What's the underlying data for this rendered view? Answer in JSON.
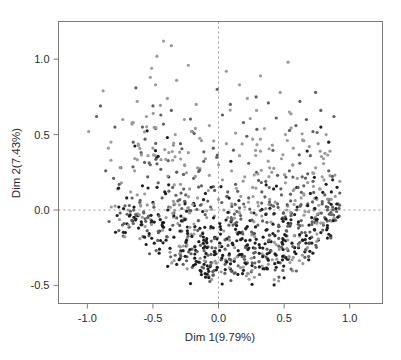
{
  "chart_data": {
    "type": "scatter",
    "title": "",
    "xlabel": "Dim 1(9.79%)",
    "ylabel": "Dim 2(7.43%)",
    "xlim": [
      -1.22,
      1.25
    ],
    "ylim": [
      -0.62,
      1.25
    ],
    "xticks": [
      -1.0,
      -0.5,
      0.0,
      0.5,
      1.0
    ],
    "xticklabels": [
      "-1.0",
      "-0.5",
      "0.0",
      "0.5",
      "1.0"
    ],
    "yticks": [
      -0.5,
      0.0,
      0.5,
      1.0
    ],
    "yticklabels": [
      "-0.5",
      "0.0",
      "0.5",
      "1.0"
    ],
    "grid": false,
    "legend": null,
    "reference_lines": [
      {
        "axis": "vertical",
        "value": 0.0,
        "style": "dashed",
        "color": "#999999"
      },
      {
        "axis": "horizontal",
        "value": 0.0,
        "style": "dashed",
        "color": "#999999"
      }
    ],
    "marker": {
      "shape": "circle",
      "size": 1.6,
      "colors": [
        "#8f8f8f",
        "#5a5a5a",
        "#2a2a2a"
      ]
    },
    "n_points": 1020,
    "point_colors": {
      "light_gray": "#9a9a9a",
      "mid_gray": "#606060",
      "dark": "#1f1f1f"
    },
    "frame_color": "#7a7a7a",
    "background": "#ffffff",
    "points": [
      [
        -0.99,
        0.52
      ],
      [
        -0.93,
        0.62
      ],
      [
        -0.9,
        0.69
      ],
      [
        -0.88,
        0.79
      ],
      [
        -0.86,
        0.26
      ],
      [
        -0.84,
        0.41
      ],
      [
        -0.82,
        0.33
      ],
      [
        -0.8,
        0.21
      ],
      [
        -0.79,
        0.55
      ],
      [
        -0.77,
        0.14
      ],
      [
        -0.76,
        0.02
      ],
      [
        -0.75,
        -0.02
      ],
      [
        -0.74,
        0.18
      ],
      [
        -0.73,
        0.6
      ],
      [
        -0.72,
        -0.09
      ],
      [
        -0.71,
        -0.15
      ],
      [
        -0.7,
        0.08
      ],
      [
        -0.69,
        0.0
      ],
      [
        -0.68,
        0.03
      ],
      [
        -0.68,
        -0.04
      ],
      [
        -0.67,
        0.12
      ],
      [
        -0.66,
        0.57
      ],
      [
        -0.65,
        0.58
      ],
      [
        -0.65,
        0.45
      ],
      [
        -0.64,
        0.26
      ],
      [
        -0.63,
        -0.06
      ],
      [
        -0.63,
        0.81
      ],
      [
        -0.62,
        0.72
      ],
      [
        -0.62,
        0.1
      ],
      [
        -0.61,
        -0.12
      ],
      [
        -0.6,
        0.05
      ],
      [
        -0.6,
        -0.19
      ],
      [
        -0.59,
        0.38
      ],
      [
        -0.58,
        0.55
      ],
      [
        -0.58,
        0.16
      ],
      [
        -0.57,
        -0.02
      ],
      [
        -0.56,
        -0.11
      ],
      [
        -0.56,
        0.47
      ],
      [
        -0.55,
        0.62
      ],
      [
        -0.54,
        0.22
      ],
      [
        -0.54,
        -0.05
      ],
      [
        -0.53,
        -0.17
      ],
      [
        -0.52,
        0.3
      ],
      [
        -0.52,
        0.88
      ],
      [
        -0.51,
        0.94
      ],
      [
        -0.5,
        0.69
      ],
      [
        -0.5,
        0.41
      ],
      [
        -0.5,
        0.05
      ],
      [
        -0.49,
        -0.08
      ],
      [
        -0.49,
        -0.22
      ],
      [
        -0.48,
        0.54
      ],
      [
        -0.48,
        0.83
      ],
      [
        -0.47,
        1.02
      ],
      [
        -0.47,
        0.35
      ],
      [
        -0.46,
        0.18
      ],
      [
        -0.46,
        -0.03
      ],
      [
        -0.45,
        -0.14
      ],
      [
        -0.45,
        -0.26
      ],
      [
        -0.44,
        0.63
      ],
      [
        -0.44,
        0.27
      ],
      [
        -0.43,
        0.08
      ],
      [
        -0.43,
        -0.1
      ],
      [
        -0.42,
        1.12
      ],
      [
        -0.42,
        0.57
      ],
      [
        -0.41,
        0.4
      ],
      [
        -0.41,
        0.12
      ],
      [
        -0.4,
        -0.05
      ],
      [
        -0.4,
        -0.2
      ],
      [
        -0.39,
        0.74
      ],
      [
        -0.39,
        0.48
      ],
      [
        -0.38,
        0.22
      ],
      [
        -0.38,
        0.02
      ],
      [
        -0.37,
        -0.13
      ],
      [
        -0.37,
        -0.28
      ],
      [
        -0.36,
        1.09
      ],
      [
        -0.36,
        0.66
      ],
      [
        -0.35,
        0.33
      ],
      [
        -0.35,
        0.15
      ],
      [
        -0.34,
        -0.02
      ],
      [
        -0.34,
        -0.18
      ],
      [
        -0.33,
        -0.3
      ],
      [
        -0.33,
        0.5
      ],
      [
        -0.32,
        0.86
      ],
      [
        -0.32,
        0.25
      ],
      [
        -0.31,
        0.06
      ],
      [
        -0.31,
        -0.09
      ],
      [
        -0.3,
        -0.24
      ],
      [
        -0.3,
        -0.33
      ],
      [
        -0.29,
        0.44
      ],
      [
        -0.29,
        0.17
      ],
      [
        -0.28,
        0.01
      ],
      [
        -0.28,
        -0.14
      ],
      [
        -0.27,
        -0.27
      ],
      [
        -0.27,
        -0.36
      ],
      [
        -0.26,
        0.6
      ],
      [
        -0.26,
        0.3
      ],
      [
        -0.25,
        0.1
      ],
      [
        -0.25,
        -0.06
      ],
      [
        -0.24,
        -0.19
      ],
      [
        -0.24,
        -0.31
      ],
      [
        -0.23,
        0.96
      ],
      [
        -0.23,
        0.38
      ],
      [
        -0.22,
        0.14
      ],
      [
        -0.22,
        -0.02
      ],
      [
        -0.21,
        -0.16
      ],
      [
        -0.21,
        -0.29
      ],
      [
        -0.2,
        -0.38
      ],
      [
        -0.2,
        0.52
      ],
      [
        -0.19,
        0.21
      ],
      [
        -0.19,
        0.04
      ],
      [
        -0.18,
        -0.11
      ],
      [
        -0.18,
        -0.24
      ],
      [
        -0.17,
        -0.34
      ],
      [
        -0.17,
        0.7
      ],
      [
        -0.16,
        0.28
      ],
      [
        -0.16,
        0.08
      ],
      [
        -0.15,
        -0.07
      ],
      [
        -0.15,
        -0.21
      ],
      [
        -0.14,
        -0.32
      ],
      [
        -0.14,
        -0.4
      ],
      [
        -0.13,
        0.46
      ],
      [
        -0.13,
        0.16
      ],
      [
        -0.12,
        -0.01
      ],
      [
        -0.12,
        -0.15
      ],
      [
        -0.11,
        -0.27
      ],
      [
        -0.11,
        -0.36
      ],
      [
        -0.1,
        0.34
      ],
      [
        -0.1,
        0.11
      ],
      [
        -0.09,
        -0.05
      ],
      [
        -0.09,
        -0.19
      ],
      [
        -0.08,
        -0.3
      ],
      [
        -0.08,
        -0.39
      ],
      [
        -0.07,
        0.56
      ],
      [
        -0.07,
        0.23
      ],
      [
        -0.06,
        0.02
      ],
      [
        -0.06,
        -0.12
      ],
      [
        -0.05,
        -0.25
      ],
      [
        -0.05,
        -0.35
      ],
      [
        -0.04,
        -0.43
      ],
      [
        -0.04,
        0.41
      ],
      [
        -0.03,
        0.13
      ],
      [
        -0.03,
        -0.04
      ],
      [
        -0.02,
        -0.18
      ],
      [
        -0.02,
        -0.29
      ],
      [
        -0.01,
        -0.38
      ],
      [
        -0.01,
        0.8
      ],
      [
        0.0,
        0.3
      ],
      [
        0.0,
        0.07
      ],
      [
        0.01,
        -0.09
      ],
      [
        0.01,
        -0.22
      ],
      [
        0.02,
        -0.33
      ],
      [
        0.02,
        -0.41
      ],
      [
        0.03,
        0.63
      ],
      [
        0.03,
        0.2
      ],
      [
        0.04,
        0.0
      ],
      [
        0.04,
        -0.14
      ],
      [
        0.05,
        -0.26
      ],
      [
        0.05,
        -0.36
      ],
      [
        0.06,
        0.92
      ],
      [
        0.06,
        0.44
      ],
      [
        0.07,
        0.12
      ],
      [
        0.07,
        -0.05
      ],
      [
        0.08,
        -0.18
      ],
      [
        0.08,
        -0.3
      ],
      [
        0.09,
        -0.39
      ],
      [
        0.09,
        0.7
      ],
      [
        0.1,
        0.26
      ],
      [
        0.1,
        0.04
      ],
      [
        0.11,
        -0.1
      ],
      [
        0.11,
        -0.23
      ],
      [
        0.12,
        -0.34
      ],
      [
        0.12,
        -0.42
      ],
      [
        0.13,
        0.51
      ],
      [
        0.13,
        0.17
      ],
      [
        0.14,
        -0.01
      ],
      [
        0.14,
        -0.15
      ],
      [
        0.15,
        -0.27
      ],
      [
        0.15,
        -0.37
      ],
      [
        0.16,
        0.83
      ],
      [
        0.16,
        0.36
      ],
      [
        0.17,
        0.09
      ],
      [
        0.17,
        -0.06
      ],
      [
        0.18,
        -0.19
      ],
      [
        0.18,
        -0.31
      ],
      [
        0.19,
        -0.4
      ],
      [
        0.19,
        0.58
      ],
      [
        0.2,
        0.22
      ],
      [
        0.2,
        0.02
      ],
      [
        0.21,
        -0.12
      ],
      [
        0.21,
        -0.24
      ],
      [
        0.22,
        -0.35
      ],
      [
        0.22,
        0.74
      ],
      [
        0.23,
        0.31
      ],
      [
        0.23,
        0.08
      ],
      [
        0.24,
        -0.07
      ],
      [
        0.24,
        -0.2
      ],
      [
        0.25,
        -0.32
      ],
      [
        0.25,
        -0.41
      ],
      [
        0.26,
        0.47
      ],
      [
        0.26,
        0.15
      ],
      [
        0.27,
        -0.02
      ],
      [
        0.27,
        -0.16
      ],
      [
        0.28,
        -0.28
      ],
      [
        0.28,
        -0.38
      ],
      [
        0.29,
        0.66
      ],
      [
        0.29,
        0.25
      ],
      [
        0.3,
        0.05
      ],
      [
        0.3,
        -0.1
      ],
      [
        0.31,
        -0.23
      ],
      [
        0.31,
        -0.34
      ],
      [
        0.32,
        0.89
      ],
      [
        0.32,
        0.39
      ],
      [
        0.33,
        0.12
      ],
      [
        0.33,
        -0.04
      ],
      [
        0.34,
        -0.18
      ],
      [
        0.34,
        -0.3
      ],
      [
        0.35,
        -0.39
      ],
      [
        0.35,
        0.54
      ],
      [
        0.36,
        0.19
      ],
      [
        0.36,
        0.01
      ],
      [
        0.37,
        -0.13
      ],
      [
        0.37,
        -0.26
      ],
      [
        0.38,
        -0.36
      ],
      [
        0.38,
        0.71
      ],
      [
        0.39,
        0.28
      ],
      [
        0.39,
        0.07
      ],
      [
        0.4,
        -0.08
      ],
      [
        0.4,
        -0.21
      ],
      [
        0.41,
        -0.33
      ],
      [
        0.41,
        0.43
      ],
      [
        0.42,
        0.14
      ],
      [
        0.42,
        -0.03
      ],
      [
        0.43,
        -0.17
      ],
      [
        0.43,
        -0.29
      ],
      [
        0.44,
        -0.38
      ],
      [
        0.44,
        0.61
      ],
      [
        0.45,
        0.23
      ],
      [
        0.45,
        0.04
      ],
      [
        0.46,
        -0.11
      ],
      [
        0.46,
        -0.24
      ],
      [
        0.47,
        -0.35
      ],
      [
        0.47,
        0.78
      ],
      [
        0.48,
        0.34
      ],
      [
        0.48,
        0.1
      ],
      [
        0.49,
        -0.05
      ],
      [
        0.49,
        -0.19
      ],
      [
        0.5,
        -0.31
      ],
      [
        0.5,
        -0.45
      ],
      [
        0.51,
        0.5
      ],
      [
        0.51,
        0.18
      ],
      [
        0.52,
        0.0
      ],
      [
        0.52,
        -0.14
      ],
      [
        0.53,
        -0.27
      ],
      [
        0.53,
        0.98
      ],
      [
        0.54,
        0.65
      ],
      [
        0.54,
        0.26
      ],
      [
        0.55,
        0.06
      ],
      [
        0.55,
        -0.09
      ],
      [
        0.56,
        -0.22
      ],
      [
        0.56,
        -0.33
      ],
      [
        0.57,
        0.41
      ],
      [
        0.57,
        0.13
      ],
      [
        0.58,
        -0.03
      ],
      [
        0.58,
        -0.17
      ],
      [
        0.59,
        -0.29
      ],
      [
        0.59,
        0.56
      ],
      [
        0.6,
        0.21
      ],
      [
        0.6,
        0.02
      ],
      [
        0.61,
        -0.12
      ],
      [
        0.61,
        -0.25
      ],
      [
        0.62,
        0.72
      ],
      [
        0.62,
        0.31
      ],
      [
        0.63,
        0.08
      ],
      [
        0.63,
        -0.07
      ],
      [
        0.64,
        -0.2
      ],
      [
        0.64,
        -0.3
      ],
      [
        0.65,
        0.46
      ],
      [
        0.65,
        0.16
      ],
      [
        0.66,
        -0.01
      ],
      [
        0.66,
        -0.15
      ],
      [
        0.67,
        -0.26
      ],
      [
        0.67,
        0.6
      ],
      [
        0.68,
        0.24
      ],
      [
        0.68,
        0.04
      ],
      [
        0.69,
        -0.1
      ],
      [
        0.69,
        -0.22
      ],
      [
        0.7,
        0.36
      ],
      [
        0.7,
        0.11
      ],
      [
        0.71,
        -0.05
      ],
      [
        0.71,
        -0.18
      ],
      [
        0.72,
        0.52
      ],
      [
        0.72,
        0.19
      ],
      [
        0.73,
        0.01
      ],
      [
        0.73,
        -0.13
      ],
      [
        0.74,
        0.78
      ],
      [
        0.74,
        0.28
      ],
      [
        0.75,
        0.07
      ],
      [
        0.75,
        -0.08
      ],
      [
        0.76,
        -0.2
      ],
      [
        0.76,
        0.44
      ],
      [
        0.77,
        0.14
      ],
      [
        0.77,
        -0.02
      ],
      [
        0.78,
        -0.15
      ],
      [
        0.78,
        0.66
      ],
      [
        0.79,
        0.22
      ],
      [
        0.79,
        0.04
      ],
      [
        0.8,
        -0.1
      ],
      [
        0.8,
        0.34
      ],
      [
        0.81,
        0.1
      ],
      [
        0.81,
        -0.05
      ],
      [
        0.82,
        0.5
      ],
      [
        0.82,
        0.17
      ],
      [
        0.83,
        0.0
      ],
      [
        0.83,
        -0.12
      ],
      [
        0.84,
        0.26
      ],
      [
        0.84,
        0.07
      ],
      [
        0.85,
        -0.07
      ],
      [
        0.85,
        0.39
      ],
      [
        0.86,
        0.12
      ],
      [
        0.86,
        -0.03
      ],
      [
        0.87,
        0.2
      ],
      [
        0.87,
        0.02
      ],
      [
        0.88,
        -0.06
      ],
      [
        0.89,
        0.09
      ],
      [
        0.9,
        -0.01
      ],
      [
        0.91,
        0.04
      ],
      [
        0.92,
        -0.04
      ],
      [
        0.84,
        0.45
      ],
      [
        0.78,
        0.55
      ],
      [
        0.88,
        0.62
      ]
    ]
  },
  "axes": {
    "x_title": "Dim 1(9.79%)",
    "y_title": "Dim 2(7.43%)"
  }
}
